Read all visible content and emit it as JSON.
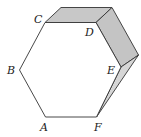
{
  "figure": {
    "colors": {
      "stroke": "#333333",
      "face_top": "#c8c8c8",
      "face_right": "#c4c4c4",
      "face_lower": "#d6d6d6",
      "hexagon_fill": "#ffffff"
    },
    "vertices": {
      "A": {
        "label": "A",
        "x": 45.5,
        "y": 117
      },
      "B": {
        "label": "B",
        "x": 19.5,
        "y": 70
      },
      "C": {
        "label": "C",
        "x": 45,
        "y": 22.5
      },
      "D": {
        "label": "D",
        "x": 96,
        "y": 22.5
      },
      "E": {
        "label": "E",
        "x": 121,
        "y": 67
      },
      "F": {
        "label": "F",
        "x": 96.5,
        "y": 117
      }
    },
    "labels": [
      {
        "text": "C",
        "x": 34,
        "y": 23
      },
      {
        "text": "D",
        "x": 85,
        "y": 36
      },
      {
        "text": "B",
        "x": 7,
        "y": 74
      },
      {
        "text": "E",
        "x": 107,
        "y": 74
      },
      {
        "text": "A",
        "x": 40,
        "y": 131
      },
      {
        "text": "F",
        "x": 94,
        "y": 131
      }
    ]
  }
}
